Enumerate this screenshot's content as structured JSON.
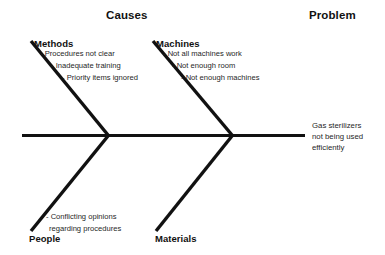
{
  "diagram": {
    "type": "fishbone-ishikawa",
    "headers": {
      "causes": "Causes",
      "problem": "Problem"
    },
    "problem_statement": {
      "line1": "Gas sterilizers",
      "line2": "not being used",
      "line3": "efficiently"
    },
    "branches": [
      {
        "id": "methods",
        "label": "Methods",
        "position": "upper-left",
        "causes": [
          "- Procedures not clear",
          "- Inadequate training",
          "- Priority items ignored"
        ]
      },
      {
        "id": "machines",
        "label": "Machines",
        "position": "upper-right",
        "causes": [
          "- Not all machines work",
          "- Not enough room",
          "- Not enough machines"
        ]
      },
      {
        "id": "people",
        "label": "People",
        "position": "lower-left",
        "causes": [
          "- Conflicting opinions",
          "regarding procedures"
        ]
      },
      {
        "id": "materials",
        "label": "Materials",
        "position": "lower-right",
        "causes": []
      }
    ],
    "colors": {
      "line": "#111111",
      "text": "#1a1a1a",
      "background": "#ffffff"
    }
  }
}
